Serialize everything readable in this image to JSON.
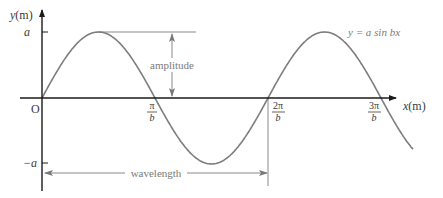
{
  "diagram": {
    "equation": "y = a sin bx",
    "y_axis": {
      "label": "y",
      "unit": "(m)"
    },
    "x_axis": {
      "label": "x",
      "unit": "(m)"
    },
    "origin_label": "O",
    "y_ticks": [
      {
        "label": "a"
      },
      {
        "label": "−a"
      }
    ],
    "x_ticks": [
      {
        "num": "π",
        "den": "b"
      },
      {
        "num": "2π",
        "den": "b"
      },
      {
        "num": "3π",
        "den": "b"
      }
    ],
    "annotations": {
      "amplitude": "amplitude",
      "wavelength": "wavelength"
    },
    "colors": {
      "axis": "#1a1a1a",
      "curve": "#7d7d7d",
      "annotation": "#8a8a8a",
      "text": "#3a3a3a"
    }
  }
}
